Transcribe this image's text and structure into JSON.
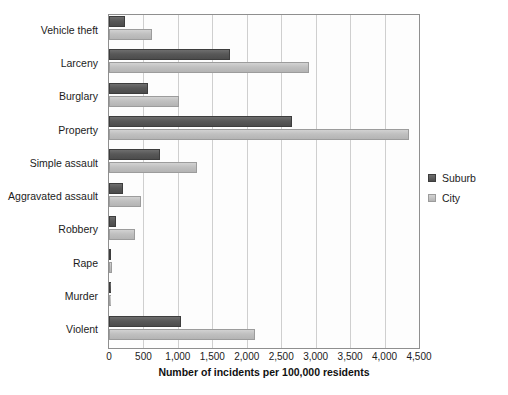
{
  "chart_data": {
    "type": "bar",
    "orientation": "horizontal",
    "title": "",
    "xlabel": "Number of incidents per 100,000 residents",
    "ylabel": "",
    "xlim": [
      0,
      4500
    ],
    "xticks": [
      0,
      500,
      1000,
      1500,
      2000,
      2500,
      3000,
      3500,
      4000,
      4500
    ],
    "xticklabels": [
      "0",
      "500",
      "1,000",
      "1,500",
      "2,000",
      "2,500",
      "3,000",
      "3,500",
      "4,000",
      "4,500"
    ],
    "grid": "vertical",
    "legend_position": "right",
    "categories": [
      "Vehicle theft",
      "Larceny",
      "Burglary",
      "Property",
      "Simple assault",
      "Aggravated assault",
      "Robbery",
      "Rape",
      "Murder",
      "Violent"
    ],
    "series": [
      {
        "name": "Suburb",
        "color": "#555555",
        "values": [
          230,
          1750,
          560,
          2650,
          740,
          200,
          100,
          30,
          10,
          1050
        ]
      },
      {
        "name": "City",
        "color": "#c2c2c2",
        "values": [
          620,
          2900,
          1020,
          4350,
          1280,
          460,
          380,
          45,
          20,
          2120
        ]
      }
    ]
  },
  "legend": {
    "items": [
      {
        "label": "Suburb",
        "swatch": "suburb-swatch"
      },
      {
        "label": "City",
        "swatch": "city-swatch"
      }
    ]
  }
}
